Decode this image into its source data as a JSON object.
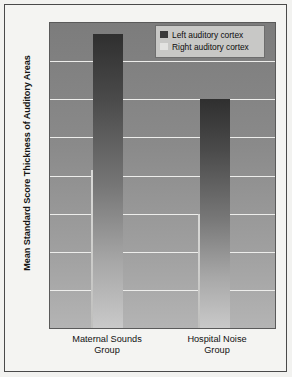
{
  "chart_data": {
    "type": "bar",
    "title": "",
    "xlabel": "",
    "ylabel": "Mean Standard Score Thickness of Auditory Areas",
    "categories": [
      "Maternal Sounds\nGroup",
      "Hospital Noise\nGroup"
    ],
    "category_lines": [
      [
        "Maternal Sounds",
        "Group"
      ],
      [
        "Hospital Noise",
        "Group"
      ]
    ],
    "series": [
      {
        "name": "Left auditory cortex",
        "values": [
          7.7,
          6.0
        ],
        "color": "#3a3a3a"
      },
      {
        "name": "Right auditory cortex",
        "values": [
          4.15,
          3.0
        ],
        "color": "#e2e2e0"
      }
    ],
    "ylim": [
      0,
      8
    ],
    "yticks": [
      8,
      7,
      6,
      5,
      4,
      3,
      2,
      1,
      0
    ],
    "ytick_labels": [
      "8",
      "7",
      "6",
      "5",
      "4",
      "3",
      "2",
      "1",
      "0"
    ],
    "grid": true,
    "legend_position": "top-right",
    "legend_entries": [
      "Left auditory cortex",
      "Right auditory cortex"
    ]
  },
  "axis": {
    "y_title": "Mean Standard Score Thickness of Auditory Areas"
  },
  "legend": {
    "items": [
      {
        "label": "Left auditory cortex"
      },
      {
        "label": "Right auditory cortex"
      }
    ]
  },
  "xcats": [
    {
      "line1": "Maternal Sounds",
      "line2": "Group"
    },
    {
      "line1": "Hospital Noise",
      "line2": "Group"
    }
  ],
  "colors": {
    "frame": "#4a4a4a",
    "background": "#f2f2f0",
    "plot_background": "#8a8a8a",
    "gridline": "#ededeb",
    "left_series": "#3a3a3a",
    "right_series": "#e2e2e0"
  }
}
